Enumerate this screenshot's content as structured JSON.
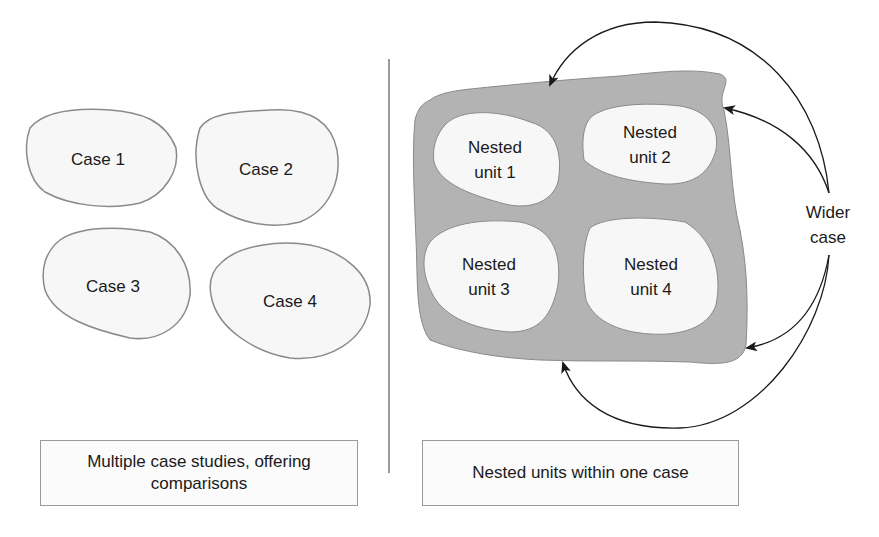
{
  "left_panel": {
    "cases": [
      {
        "label": "Case 1"
      },
      {
        "label": "Case 2"
      },
      {
        "label": "Case 3"
      },
      {
        "label": "Case 4"
      }
    ],
    "caption_line1": "Multiple case studies, offering",
    "caption_line2": "comparisons"
  },
  "right_panel": {
    "nested_units": [
      {
        "line1": "Nested",
        "line2": "unit 1"
      },
      {
        "line1": "Nested",
        "line2": "unit 2"
      },
      {
        "line1": "Nested",
        "line2": "unit 3"
      },
      {
        "line1": "Nested",
        "line2": "unit 4"
      }
    ],
    "wider_case_line1": "Wider",
    "wider_case_line2": "case",
    "caption": "Nested units within one case"
  },
  "colors": {
    "blob_fill": "#f7f7f7",
    "blob_stroke": "#8a8a8a",
    "wider_case_fill": "#b3b3b3",
    "arrow": "#1a1a1a",
    "divider": "#9a9a9a"
  }
}
